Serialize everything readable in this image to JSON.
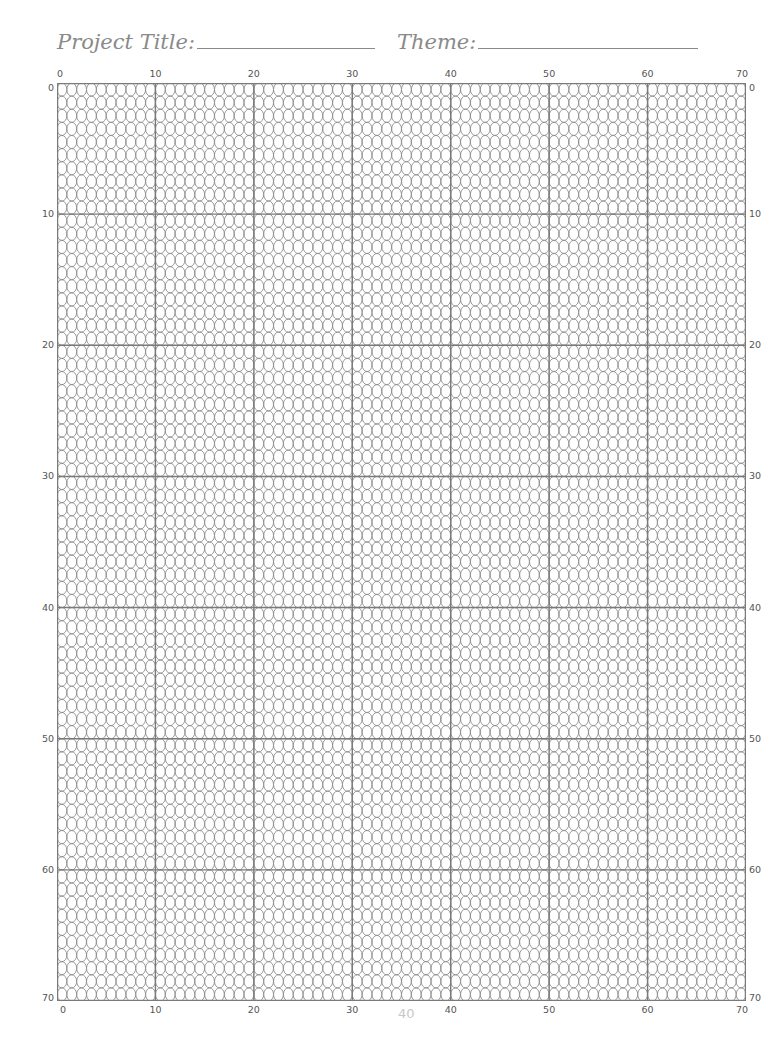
{
  "header": {
    "project_title_label": "Project Title:",
    "theme_label": "Theme:"
  },
  "grid": {
    "columns": 70,
    "rows": 70,
    "cell_shape": "oval",
    "major_every": 10,
    "column_labels": [
      "0",
      "10",
      "20",
      "30",
      "40",
      "50",
      "60",
      "70"
    ],
    "row_labels": [
      "0",
      "10",
      "20",
      "30",
      "40",
      "50",
      "60",
      "70"
    ],
    "stroke_color": "#8c8c8c",
    "major_line_color": "#7a7a7a"
  },
  "footer": {
    "page_number": "40"
  }
}
